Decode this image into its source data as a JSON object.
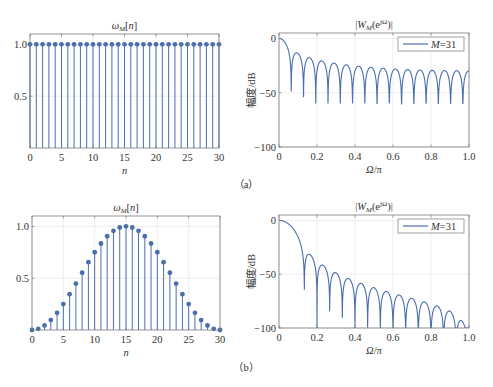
{
  "captions": [
    "（a）",
    "（b）"
  ],
  "colors": {
    "series": "#4a6fae",
    "grid": "#e6e6e6",
    "axis": "#7a7a7a",
    "text": "#333333"
  },
  "chart_data": [
    {
      "id": "a-time",
      "type": "stem",
      "title": "ωM[n]",
      "xlabel": "n",
      "ylabel": "",
      "window": "rectangular",
      "M": 31,
      "x": [
        0,
        1,
        2,
        3,
        4,
        5,
        6,
        7,
        8,
        9,
        10,
        11,
        12,
        13,
        14,
        15,
        16,
        17,
        18,
        19,
        20,
        21,
        22,
        23,
        24,
        25,
        26,
        27,
        28,
        29,
        30
      ],
      "values": [
        1,
        1,
        1,
        1,
        1,
        1,
        1,
        1,
        1,
        1,
        1,
        1,
        1,
        1,
        1,
        1,
        1,
        1,
        1,
        1,
        1,
        1,
        1,
        1,
        1,
        1,
        1,
        1,
        1,
        1,
        1
      ],
      "xlim": [
        0,
        30
      ],
      "ylim": [
        0,
        1.1
      ],
      "xticks": [
        0,
        5,
        10,
        15,
        20,
        25,
        30
      ],
      "yticks": [
        0.5,
        1.0
      ],
      "ytick_labels": [
        "0.5",
        "1.0"
      ],
      "grid": true,
      "box": [
        30,
        34,
        219,
        148
      ]
    },
    {
      "id": "a-freq",
      "type": "line",
      "title": "|WM(e^jΩ)|",
      "xlabel": "Ω/π",
      "ylabel": "幅度/dB",
      "window": "rectangular",
      "M": 31,
      "legend": [
        "M=31"
      ],
      "legend_position": "upper right",
      "xlim": [
        0,
        1
      ],
      "ylim": [
        -100,
        5
      ],
      "floor_db": -60,
      "xticks": [
        0,
        0.2,
        0.4,
        0.6,
        0.8,
        1.0
      ],
      "xtick_labels": [
        "0",
        "0.2",
        "0.4",
        "0.6",
        "0.8",
        "1.0"
      ],
      "yticks": [
        -100,
        -50,
        0
      ],
      "ytick_labels": [
        "−100",
        "−50",
        "0"
      ],
      "grid": true,
      "box": [
        279,
        33,
        469,
        147
      ]
    },
    {
      "id": "b-time",
      "type": "stem",
      "title": "ωM[n]",
      "xlabel": "n",
      "ylabel": "",
      "window": "hann",
      "M": 31,
      "x": [
        0,
        1,
        2,
        3,
        4,
        5,
        6,
        7,
        8,
        9,
        10,
        11,
        12,
        13,
        14,
        15,
        16,
        17,
        18,
        19,
        20,
        21,
        22,
        23,
        24,
        25,
        26,
        27,
        28,
        29,
        30
      ],
      "values": [
        0.0,
        0.03,
        0.06,
        0.1,
        0.16,
        0.24,
        0.33,
        0.42,
        0.52,
        0.62,
        0.71,
        0.79,
        0.86,
        0.92,
        0.96,
        1.0,
        0.96,
        0.92,
        0.86,
        0.79,
        0.71,
        0.62,
        0.52,
        0.42,
        0.33,
        0.24,
        0.16,
        0.1,
        0.06,
        0.03,
        0.0
      ],
      "xlim": [
        0,
        30
      ],
      "ylim": [
        0,
        1.1
      ],
      "xticks": [
        0,
        5,
        10,
        15,
        20,
        25,
        30
      ],
      "yticks": [
        0.5,
        1.0
      ],
      "ytick_labels": [
        "0.5",
        "1.0"
      ],
      "grid": true,
      "box": [
        32,
        216,
        220,
        330
      ]
    },
    {
      "id": "b-freq",
      "type": "line",
      "title": "|WM(e^jΩ)|",
      "xlabel": "Ω/π",
      "ylabel": "幅度/dB",
      "window": "hann",
      "M": 31,
      "legend": [
        "M=31"
      ],
      "legend_position": "upper right",
      "xlim": [
        0,
        1
      ],
      "ylim": [
        -100,
        5
      ],
      "floor_db": -100,
      "xticks": [
        0,
        0.2,
        0.4,
        0.6,
        0.8,
        1.0
      ],
      "xtick_labels": [
        "0",
        "0.2",
        "0.4",
        "0.6",
        "0.8",
        "1.0"
      ],
      "yticks": [
        -100,
        -50,
        0
      ],
      "ytick_labels": [
        "−100",
        "−50",
        "0"
      ],
      "grid": true,
      "box": [
        279,
        215,
        469,
        328
      ]
    }
  ]
}
